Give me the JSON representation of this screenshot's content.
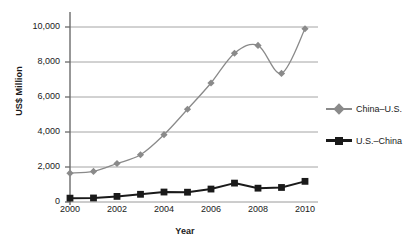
{
  "chart_data": {
    "type": "line",
    "title": "",
    "xlabel": "Year",
    "ylabel": "US$ Million",
    "x": [
      2000,
      2001,
      2002,
      2003,
      2004,
      2005,
      2006,
      2007,
      2008,
      2009,
      2010
    ],
    "xtick_labels": [
      "2000",
      "2002",
      "2004",
      "2006",
      "2008",
      "2010"
    ],
    "xtick_values": [
      2000,
      2002,
      2004,
      2006,
      2008,
      2010
    ],
    "ytick_labels": [
      "0",
      "2,000",
      "4,000",
      "6,000",
      "8,000",
      "10,000"
    ],
    "ytick_values": [
      0,
      2000,
      4000,
      6000,
      8000,
      10000
    ],
    "xlim": [
      2000,
      2010
    ],
    "ylim": [
      0,
      10000
    ],
    "grid": "horizontal",
    "legend_position": "right",
    "series": [
      {
        "name": "China–U.S.",
        "color": "#8a8a8a",
        "marker": "diamond",
        "values": [
          1650,
          1750,
          2200,
          2700,
          3850,
          5300,
          6800,
          8500,
          8950,
          7350,
          9900
        ]
      },
      {
        "name": "U.S.–China",
        "color": "#1a1a1a",
        "marker": "square",
        "values": [
          220,
          230,
          320,
          440,
          570,
          560,
          740,
          1080,
          790,
          830,
          1180
        ]
      }
    ]
  },
  "legend": {
    "items": [
      {
        "label": "China–U.S."
      },
      {
        "label": "U.S.–China"
      }
    ]
  },
  "axes": {
    "y_title": "US$ Million",
    "x_title": "Year"
  },
  "colors": {
    "series_1": "#8a8a8a",
    "series_2": "#1a1a1a",
    "grid": "#9a9a9a",
    "axis": "#6b6b6b",
    "background": "#ffffff"
  }
}
